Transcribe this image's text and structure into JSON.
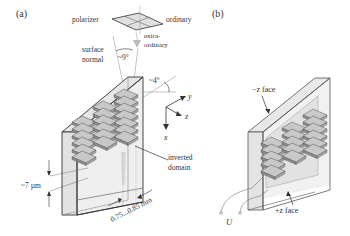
{
  "panel_a": {
    "label": "(a)",
    "polarizer": "polarizer",
    "ordinary": "ordinary",
    "extraordinary_1": "extra-",
    "extraordinary_2": "ordinary",
    "surface_1": "surface",
    "surface_2": "normal",
    "angle_9": "~9°",
    "angle_4": "~4°",
    "axis_x": "x",
    "axis_y": "y",
    "axis_z": "z",
    "inverted_1": "inverted",
    "inverted_2": "domain",
    "thickness": "~7 µm",
    "period": "0.75...0.85 mm"
  },
  "panel_b": {
    "label": "(b)",
    "minus_z": "−z face",
    "plus_z": "+z face",
    "voltage": "U"
  },
  "colors": {
    "line": "#333333",
    "crystal_fill": "#ececec",
    "domain_top": "#b8b8b8",
    "domain_side": "#8a8a8a",
    "beam": "#cccccc"
  }
}
